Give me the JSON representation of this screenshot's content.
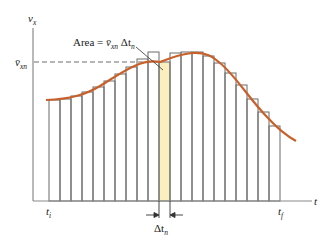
{
  "diagram": {
    "type": "riemann-sum-velocity-time",
    "y_axis_label": "v",
    "y_axis_label_sub": "x",
    "x_axis_label": "t",
    "ref_level_label": "v̄",
    "ref_level_label_sub": "xn",
    "area_label_prefix": "Area = ",
    "area_label_v": "v̄",
    "area_label_v_sub": "xn",
    "area_label_dt": " Δt",
    "area_label_dt_sub": "n",
    "t_start_label": "t",
    "t_start_sub": "i",
    "t_end_label": "t",
    "t_end_sub": "f",
    "delta_label": "Δt",
    "delta_label_sub": "n",
    "colors": {
      "curve": "#c8602a",
      "bars": "#6b6b6b",
      "highlight": "#fbefc0",
      "axis": "#8a8a8a",
      "dashed": "#6b6b6b"
    },
    "bar_count": 21,
    "highlighted_bar_index": 10,
    "bar_tops_px": [
      100,
      99,
      96,
      92,
      87,
      81,
      74,
      67,
      59,
      52,
      62,
      53,
      52,
      52,
      56,
      63,
      73,
      85,
      99,
      112,
      126
    ]
  }
}
